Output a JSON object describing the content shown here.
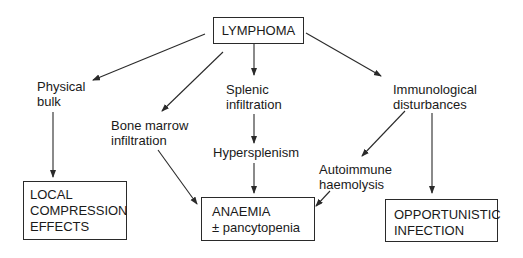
{
  "diagram": {
    "type": "flowchart",
    "root": {
      "id": "lymphoma",
      "label": "LYMPHOMA"
    },
    "intermediate": {
      "physical_bulk": {
        "lines": [
          "Physical",
          "bulk"
        ]
      },
      "bone_marrow": {
        "lines": [
          "Bone marrow",
          "infiltration"
        ]
      },
      "splenic": {
        "lines": [
          "Splenic",
          "infiltration"
        ]
      },
      "hypersplenism": {
        "lines": [
          "Hypersplenism"
        ]
      },
      "immunological": {
        "lines": [
          "Immunological",
          "disturbances"
        ]
      },
      "autoimmune": {
        "lines": [
          "Autoimmune",
          "haemolysis"
        ]
      }
    },
    "outcomes": {
      "local_compression": {
        "lines": [
          "LOCAL",
          "COMPRESSION",
          "EFFECTS"
        ]
      },
      "anaemia": {
        "lines": [
          "ANAEMIA",
          "± pancytopenia"
        ]
      },
      "opportunistic": {
        "lines": [
          "OPPORTUNISTIC",
          "INFECTION"
        ]
      }
    },
    "edges": [
      [
        "LYMPHOMA",
        "Physical bulk"
      ],
      [
        "LYMPHOMA",
        "Bone marrow infiltration"
      ],
      [
        "LYMPHOMA",
        "Splenic infiltration"
      ],
      [
        "LYMPHOMA",
        "Immunological disturbances"
      ],
      [
        "Physical bulk",
        "LOCAL COMPRESSION EFFECTS"
      ],
      [
        "Bone marrow infiltration",
        "ANAEMIA ± pancytopenia"
      ],
      [
        "Splenic infiltration",
        "Hypersplenism"
      ],
      [
        "Hypersplenism",
        "ANAEMIA ± pancytopenia"
      ],
      [
        "Immunological disturbances",
        "Autoimmune haemolysis"
      ],
      [
        "Immunological disturbances",
        "OPPORTUNISTIC INFECTION"
      ],
      [
        "Autoimmune haemolysis",
        "ANAEMIA ± pancytopenia"
      ]
    ],
    "colors": {
      "line": "#2a2a2a",
      "text": "#1a1a1a",
      "background": "#ffffff"
    }
  }
}
